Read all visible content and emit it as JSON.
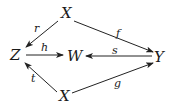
{
  "diagram": {
    "nodes": [
      {
        "id": "x_top",
        "label": "X",
        "x": 66,
        "y": 18
      },
      {
        "id": "z",
        "label": "Z",
        "x": 17,
        "y": 60
      },
      {
        "id": "w",
        "label": "W",
        "x": 73,
        "y": 61
      },
      {
        "id": "y",
        "label": "Y",
        "x": 159,
        "y": 62
      },
      {
        "id": "x_bottom",
        "label": "X",
        "x": 64,
        "y": 101
      }
    ],
    "edges": [
      {
        "id": "r",
        "label": "r",
        "from": "x_top",
        "to": "z",
        "lx": 34,
        "ly": 32
      },
      {
        "id": "f",
        "label": "f",
        "from": "x_top",
        "to": "y",
        "lx": 118,
        "ly": 37
      },
      {
        "id": "h",
        "label": "h",
        "from": "z",
        "to": "w",
        "lx": 42,
        "ly": 51
      },
      {
        "id": "s",
        "label": "s",
        "from": "y",
        "to": "w",
        "lx": 113,
        "ly": 55
      },
      {
        "id": "t",
        "label": "t",
        "from": "x_bottom",
        "to": "z",
        "lx": 31,
        "ly": 81
      },
      {
        "id": "g",
        "label": "g",
        "from": "x_bottom",
        "to": "y",
        "lx": 115,
        "ly": 87
      }
    ]
  }
}
